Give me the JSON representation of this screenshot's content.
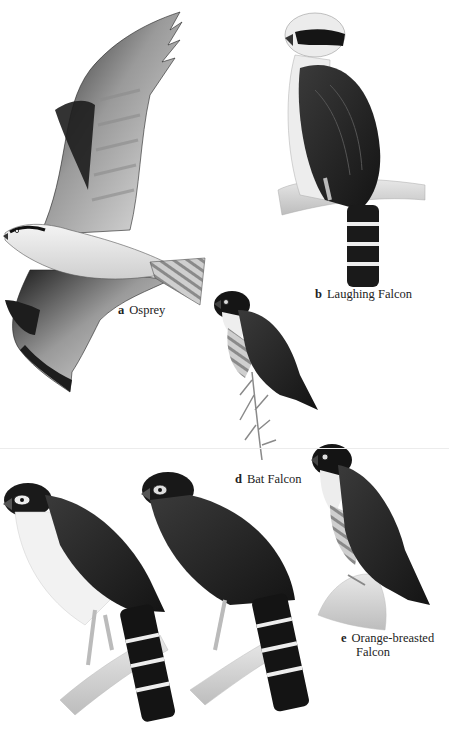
{
  "plate": {
    "type": "field-guide illustration plate",
    "style": "monochrome",
    "colors": {
      "background": "#ffffff",
      "dark_plumage": "#1f1f1f",
      "mid_gray": "#6e6e6e",
      "light_gray": "#d9d9d9",
      "label_text": "#222222"
    }
  },
  "figures": [
    {
      "id": "a",
      "letter": "a",
      "name": "Osprey",
      "pose": "in flight, wings raised"
    },
    {
      "id": "b",
      "letter": "b",
      "name": "Laughing Falcon",
      "pose": "perched on branch"
    },
    {
      "id": "d",
      "letter": "d",
      "name": "Bat Falcon",
      "pose": "perched on twig"
    },
    {
      "id": "e",
      "letter": "e",
      "name": "Orange-breasted",
      "name_line2": "Falcon",
      "pose": "perched on rock"
    },
    {
      "id": "unlabeled-1",
      "pose": "perched on branch, white-throated forest-falcon"
    },
    {
      "id": "unlabeled-2",
      "pose": "perched on branch, dark forest-falcon"
    }
  ]
}
